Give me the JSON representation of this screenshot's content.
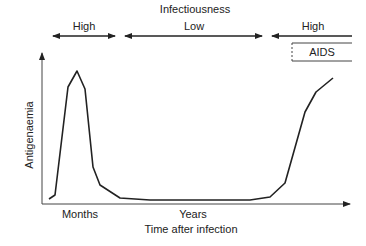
{
  "diagram": {
    "title": "Infectiousness",
    "phases": [
      {
        "label": "High",
        "x1": 53,
        "x2": 115
      },
      {
        "label": "Low",
        "x1": 125,
        "x2": 262
      },
      {
        "label": "High",
        "x1": 272,
        "x2": 352
      }
    ],
    "aids_label": "AIDS",
    "y_axis_label": "Antigenaemia",
    "x_axis_label": "Time after infection",
    "x_ticks": [
      {
        "label": "Months",
        "x": 80
      },
      {
        "label": "Years",
        "x": 193
      }
    ],
    "colors": {
      "line": "#222222",
      "background": "#ffffff"
    }
  },
  "chart_data": {
    "type": "line",
    "title": "Infectiousness",
    "xlabel": "Time after infection",
    "ylabel": "Antigenaemia",
    "x_categories": [
      "Months",
      "Years"
    ],
    "series": [
      {
        "name": "Antigenaemia",
        "points_px": [
          [
            49,
            199
          ],
          [
            55,
            195
          ],
          [
            68,
            87
          ],
          [
            77,
            71
          ],
          [
            85,
            89
          ],
          [
            93,
            167
          ],
          [
            100,
            185
          ],
          [
            120,
            198
          ],
          [
            150,
            200
          ],
          [
            250,
            200
          ],
          [
            270,
            197
          ],
          [
            285,
            183
          ],
          [
            305,
            112
          ],
          [
            316,
            92
          ],
          [
            333,
            78
          ]
        ]
      }
    ],
    "annotations": [
      "High",
      "Low",
      "High",
      "AIDS"
    ],
    "grid": false
  }
}
